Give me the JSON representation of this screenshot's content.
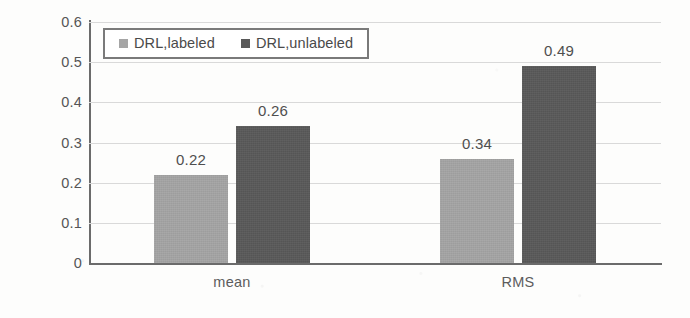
{
  "chart_data": {
    "type": "bar",
    "title": "",
    "subtitle": "",
    "xlabel": "",
    "ylabel": "Location error (m)",
    "categories": [
      "mean",
      "RMS"
    ],
    "series": [
      {
        "name": "DRL,labeled",
        "values": [
          0.22,
          0.26
        ],
        "color": "#a5a5a5"
      },
      {
        "name": "DRL,unlabeled",
        "values": [
          0.34,
          0.49
        ],
        "color": "#595959"
      }
    ],
    "value_labels": [
      [
        "0.22",
        "0.34"
      ],
      [
        "0.26",
        "0.49"
      ]
    ],
    "ylim": [
      0,
      0.6
    ],
    "ytick_values": [
      0.6,
      0.5,
      0.4,
      0.3,
      0.2,
      0.1,
      0
    ],
    "ytick_labels": [
      "0.6",
      "0.5",
      "0.4",
      "0.3",
      "0.2",
      "0.1",
      "0"
    ],
    "grid": true,
    "grid_axis": "y",
    "legend_position": "top-left",
    "legend_border": true,
    "bar_group_gap": true,
    "axis_color": "#6b6b6b",
    "grid_color": "#d9d9d9",
    "text_color": "#555555",
    "background": "#fdfdfc"
  }
}
